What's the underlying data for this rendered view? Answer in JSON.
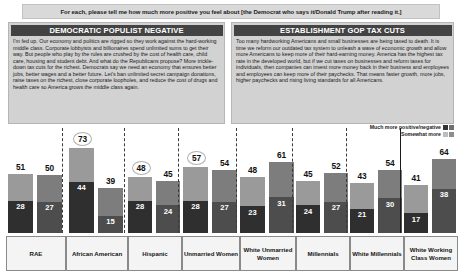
{
  "header": {
    "question": "For each, please tell me how much more positive you feel about [the Democrat who says it/Donald Trump after reading it.]"
  },
  "panels": [
    {
      "id": "democratic-populist-negative",
      "title": "DEMOCRATIC POPULIST NEGATIVE",
      "body": "I'm fed up. Our economy and politics are rigged so they work against the hard-working middle class. Corporate lobbyists and billionaires spend unlimited sums to get their way. But people who play by the rules are crushed by the cost of health care, child care, housing and student debt. And what do the Republicans propose? More trickle-down tax cuts for the richest. Democrats say we need an economy that ensures better jobs, better wages and a better future. Let's ban unlimited secret campaign donations, raise taxes on the richest, close corporate loopholes, and reduce the cost of drugs and health care so America grows the middle class again."
    },
    {
      "id": "establishment-gop-tax-cuts",
      "title": "ESTABLISHMENT GOP TAX CUTS",
      "body": "Too many hardworking Americans and small businesses are being taxed to death. It is time we reform our outdated tax system to unleash a wave of economic growth and allow more Americans to keep more of their hard-earning money. America has the highest tax rate in the developed world, but if we cut taxes on businesses and reform taxes for individuals, then companies can invest more money back in their business and employees and employees can keep more of their paychecks. That means faster growth, more jobs, higher paychecks and rising living standards for all Americans."
    }
  ],
  "legend": {
    "items": [
      {
        "label": "Much more positive/negative",
        "swatches": [
          "#333333",
          "#4d4d4d"
        ]
      },
      {
        "label": "Somewhat more",
        "swatches": [
          "#bdbdbd",
          "#8d8d8d"
        ]
      }
    ]
  },
  "chart_data": {
    "type": "bar",
    "subtype": "grouped-stacked",
    "title": "For each, please tell me how much more positive you feel about [the Democrat who says it/Donald Trump after reading it.]",
    "xlabel": "",
    "ylabel": "",
    "ylim": [
      0,
      80
    ],
    "grid": false,
    "legend_position": "top-right",
    "categories": [
      "RAE",
      "African American",
      "Hispanic",
      "Unmarried Women",
      "White Unmarried Women",
      "Millennials",
      "White Millennials",
      "White Working Class Women"
    ],
    "series": [
      {
        "name": "Democratic Populist Negative",
        "totals": [
          51,
          73,
          48,
          57,
          48,
          45,
          43,
          41
        ],
        "much_more": [
          28,
          44,
          28,
          28,
          23,
          24,
          21,
          17
        ],
        "somewhat_more": [
          23,
          29,
          20,
          29,
          25,
          21,
          22,
          24
        ],
        "circled": [
          false,
          true,
          true,
          true,
          false,
          false,
          false,
          false
        ]
      },
      {
        "name": "Establishment GOP Tax Cuts",
        "totals": [
          50,
          39,
          45,
          54,
          61,
          52,
          54,
          64
        ],
        "much_more": [
          27,
          15,
          24,
          27,
          31,
          27,
          30,
          38
        ],
        "somewhat_more": [
          23,
          24,
          21,
          27,
          30,
          25,
          24,
          26
        ],
        "circled": [
          false,
          false,
          false,
          false,
          false,
          false,
          false,
          false
        ]
      }
    ]
  }
}
